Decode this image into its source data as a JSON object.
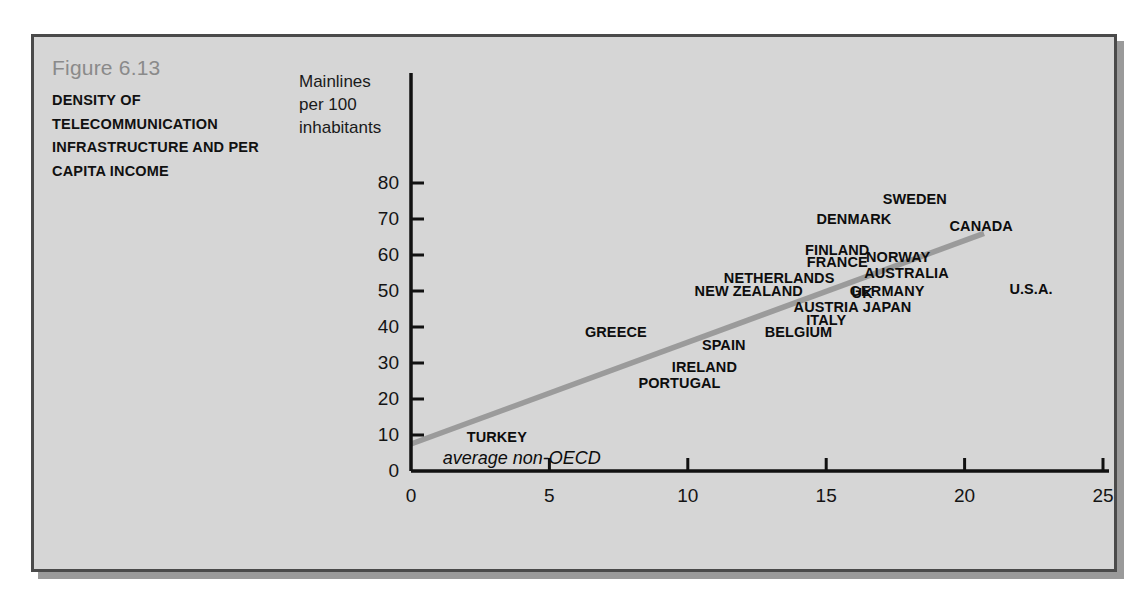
{
  "figure": {
    "number": "Figure 6.13",
    "title": "DENSITY OF TELECOMMUNICATION INFRASTRUCTURE AND PER CAPITA INCOME"
  },
  "colors": {
    "panel_background": "#d6d6d6",
    "panel_border": "#4a4a4a",
    "axis": "#111111",
    "trend_line": "#9b9b9b",
    "figure_number_text": "#8a8a8a",
    "label_text": "#0d0d0d"
  },
  "chart_data": {
    "type": "scatter",
    "title": "DENSITY OF TELECOMMUNICATION INFRASTRUCTURE AND PER CAPITA INCOME",
    "xlabel": "Real GDP per capita in $1,000s",
    "ylabel": "Mainlines per 100 inhabitants",
    "xlim": [
      0,
      25
    ],
    "ylim": [
      0,
      85
    ],
    "xticks": [
      "0",
      "5",
      "10",
      "15",
      "20",
      "25"
    ],
    "xtick_values": [
      0,
      5,
      10,
      15,
      20,
      25
    ],
    "yticks": [
      "0",
      "10",
      "20",
      "30",
      "40",
      "50",
      "60",
      "70",
      "80"
    ],
    "ytick_values": [
      0,
      10,
      20,
      30,
      40,
      50,
      60,
      70,
      80
    ],
    "grid": false,
    "legend": "none",
    "point_marker": "text-label",
    "points": [
      {
        "label": "TURKEY",
        "x": 3.1,
        "y": 9.5
      },
      {
        "label": "GREECE",
        "x": 7.4,
        "y": 38.5
      },
      {
        "label": "PORTUGAL",
        "x": 9.7,
        "y": 24.5
      },
      {
        "label": "IRELAND",
        "x": 10.6,
        "y": 29.0
      },
      {
        "label": "SPAIN",
        "x": 11.3,
        "y": 35.0
      },
      {
        "label": "NEW ZEALAND",
        "x": 12.2,
        "y": 50.0
      },
      {
        "label": "NETHERLANDS",
        "x": 13.3,
        "y": 53.5
      },
      {
        "label": "BELGIUM",
        "x": 14.0,
        "y": 38.5
      },
      {
        "label": "ITALY",
        "x": 15.0,
        "y": 42.0
      },
      {
        "label": "AUSTRIA",
        "x": 15.0,
        "y": 45.5
      },
      {
        "label": "FRANCE",
        "x": 15.4,
        "y": 58.0
      },
      {
        "label": "FINLAND",
        "x": 15.4,
        "y": 61.5
      },
      {
        "label": "DENMARK",
        "x": 16.0,
        "y": 70.0
      },
      {
        "label": "UK",
        "x": 16.3,
        "y": 49.5
      },
      {
        "label": "GERMANY",
        "x": 17.2,
        "y": 50.0
      },
      {
        "label": "JAPAN",
        "x": 17.2,
        "y": 45.5
      },
      {
        "label": "NORWAY",
        "x": 17.6,
        "y": 59.5
      },
      {
        "label": "AUSTRALIA",
        "x": 17.9,
        "y": 55.0
      },
      {
        "label": "SWEDEN",
        "x": 18.2,
        "y": 75.5
      },
      {
        "label": "CANADA",
        "x": 20.6,
        "y": 68.0
      },
      {
        "label": "U.S.A.",
        "x": 22.4,
        "y": 50.5
      }
    ],
    "trend_line": {
      "label": "regression line",
      "x_start": 0.0,
      "y_start": 7.5,
      "x_end": 20.7,
      "y_end": 66.0
    },
    "annotations": [
      {
        "text": "average non-OECD",
        "x": 4.0,
        "y": 3.5,
        "style": "italic"
      }
    ]
  }
}
